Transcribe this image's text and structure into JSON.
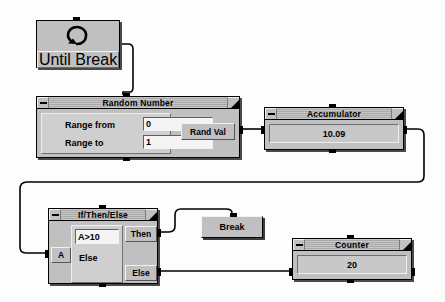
{
  "diagram": {
    "background": "#fdfdfd",
    "nodes": {
      "until_break": {
        "label": "Until Break",
        "icon": "loop-arrow-icon"
      },
      "random_number": {
        "title": "Random Number",
        "minimize_label": "–",
        "grow_label": "resize",
        "fields": [
          {
            "label": "Range from",
            "value": "0"
          },
          {
            "label": "Range to",
            "value": "1"
          }
        ],
        "output_port": "Rand Val"
      },
      "accumulator": {
        "title": "Accumulator",
        "value": "10.09"
      },
      "if_then_else": {
        "title": "If/Then/Else",
        "input_port": "A",
        "condition": "A>10",
        "else_label": "Else",
        "then_port": "Then",
        "else_port": "Else"
      },
      "break_button": {
        "label": "Break"
      },
      "counter": {
        "title": "Counter",
        "value": "20"
      }
    },
    "colors": {
      "face": "#c0c0c0",
      "shadow": "#4a4a4a",
      "wire": "#000000",
      "input_bg": "#f4f4f4",
      "field_bg": "#c8c8c8"
    }
  }
}
